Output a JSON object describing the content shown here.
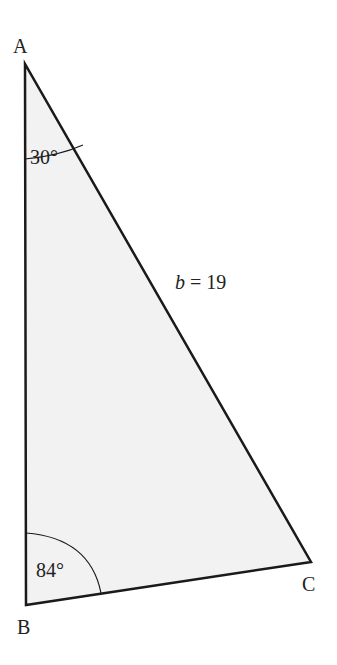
{
  "figure": {
    "type": "triangle",
    "vertices": {
      "A": {
        "label": "A",
        "x": 25,
        "y": 64
      },
      "B": {
        "label": "B",
        "x": 26,
        "y": 605
      },
      "C": {
        "label": "C",
        "x": 311,
        "y": 562
      }
    },
    "angles": {
      "A": {
        "value": "30°"
      },
      "B": {
        "value": "84°"
      }
    },
    "sides": {
      "b": {
        "var": "b",
        "eq": " = 19"
      }
    },
    "colors": {
      "fill": "#f2f2f2",
      "stroke": "#1a1a1a"
    }
  }
}
